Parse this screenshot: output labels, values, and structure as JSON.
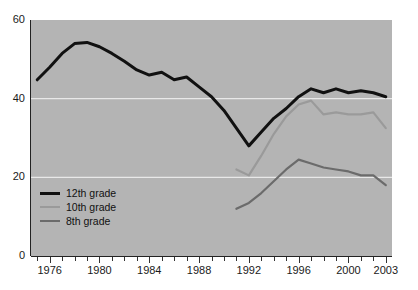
{
  "figure": {
    "background_color": "#ffffff",
    "plot_background_color": "#b4b4b4",
    "gridline_color": "#e8e8e8",
    "axis_color": "#222222",
    "title_fragment": ""
  },
  "legend": {
    "position": "inside-lower-left",
    "entries": [
      {
        "label": "12th grade",
        "color": "#111111",
        "width": 3
      },
      {
        "label": "10th grade",
        "color": "#9a9a9a",
        "width": 2.4
      },
      {
        "label": "8th grade",
        "color": "#6b6b6b",
        "width": 2.4
      }
    ]
  },
  "axes": {
    "y_ticks": [
      "0",
      "20",
      "40",
      "60"
    ],
    "y_tick_values": [
      0,
      20,
      40,
      60
    ],
    "x_major_labels": [
      "1976",
      "1980",
      "1984",
      "1988",
      "1992",
      "1996",
      "2000",
      "2003"
    ],
    "x_major_values": [
      1976,
      1980,
      1984,
      1988,
      1992,
      1996,
      2000,
      2003
    ],
    "x_minor_start": 1975,
    "x_minor_end": 2003
  },
  "chart_data": {
    "type": "line",
    "title": "",
    "xlabel": "",
    "ylabel": "",
    "xlim": [
      1974.5,
      2003.5
    ],
    "ylim": [
      0,
      60
    ],
    "grid": true,
    "grid_axis": "y",
    "grid_values": [
      20,
      40
    ],
    "legend_position": "lower left (inside axes)",
    "x": [
      1975,
      1976,
      1977,
      1978,
      1979,
      1980,
      1981,
      1982,
      1983,
      1984,
      1985,
      1986,
      1987,
      1988,
      1989,
      1990,
      1991,
      1992,
      1993,
      1994,
      1995,
      1996,
      1997,
      1998,
      1999,
      2000,
      2001,
      2002,
      2003
    ],
    "series": [
      {
        "name": "12th grade",
        "color": "#111111",
        "values": [
          44.8,
          48.0,
          51.5,
          54.0,
          54.3,
          53.2,
          51.5,
          49.5,
          47.3,
          46.0,
          46.7,
          44.8,
          45.5,
          43.0,
          40.5,
          37.0,
          32.5,
          28.0,
          31.5,
          35.0,
          37.5,
          40.5,
          42.5,
          41.5,
          42.5,
          41.5,
          42.0,
          41.5,
          40.5
        ]
      },
      {
        "name": "10th grade",
        "color": "#9a9a9a",
        "values": [
          null,
          null,
          null,
          null,
          null,
          null,
          null,
          null,
          null,
          null,
          null,
          null,
          null,
          null,
          null,
          null,
          22.0,
          20.5,
          25.5,
          31.0,
          35.5,
          38.5,
          39.5,
          36.0,
          36.5,
          36.0,
          36.0,
          36.5,
          32.5
        ]
      },
      {
        "name": "8th grade",
        "color": "#6b6b6b",
        "values": [
          null,
          null,
          null,
          null,
          null,
          null,
          null,
          null,
          null,
          null,
          null,
          null,
          null,
          null,
          null,
          null,
          12.0,
          13.5,
          16.0,
          19.0,
          22.0,
          24.5,
          23.5,
          22.5,
          22.0,
          21.5,
          20.5,
          20.5,
          18.0
        ]
      }
    ]
  }
}
